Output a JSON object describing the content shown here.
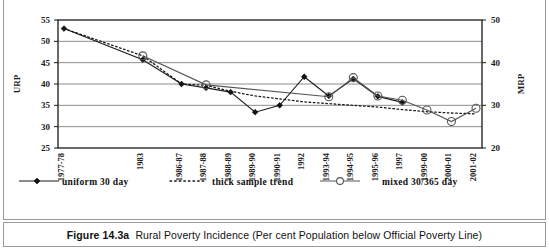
{
  "figure": {
    "caption_label": "Figure 14.3a",
    "caption_text": "Rural Poverty Incidence (Per cent Population below Official Poverty Line)"
  },
  "legend": {
    "position": "bottom",
    "items": [
      {
        "label": "uniform 30 day",
        "marker": "filled-diamond",
        "line": "solid",
        "color": "#1a1a1a"
      },
      {
        "label": "thick sample trend",
        "marker": "none",
        "line": "dotted",
        "color": "#1a1a1a"
      },
      {
        "label": "mixed 30/365 day",
        "marker": "open-circle",
        "line": "solid",
        "color": "#555555"
      }
    ]
  },
  "chart_data": {
    "type": "line",
    "title": "",
    "xlabel": "",
    "ylabel": "URP",
    "y2label": "MRP",
    "grid": true,
    "ylim": [
      25,
      55
    ],
    "yticks": [
      25,
      30,
      35,
      40,
      45,
      50,
      55
    ],
    "y2lim": [
      20,
      50
    ],
    "y2ticks": [
      20,
      30,
      40,
      50
    ],
    "categories": [
      "1977-78",
      "1983",
      "1986-87",
      "1987-88",
      "1988-89",
      "1989-90",
      "1990-91",
      "1992",
      "1993-94",
      "1994-95",
      "1995-96",
      "1997",
      "1999-00",
      "2000-01",
      "2001-02"
    ],
    "x_positions": [
      0,
      3.05,
      4.55,
      5.5,
      6.45,
      7.4,
      8.35,
      9.3,
      10.25,
      11.2,
      12.15,
      13.1,
      14.05,
      15.0,
      15.95
    ],
    "series": [
      {
        "name": "uniform 30 day",
        "axis": "left",
        "values": [
          53.0,
          45.7,
          40.0,
          39.1,
          38.1,
          33.4,
          35.0,
          41.7,
          37.2,
          41.2,
          37.1,
          35.7,
          null,
          null,
          null
        ]
      },
      {
        "name": "thick sample trend",
        "axis": "left",
        "values": [
          53.0,
          46.6,
          40.0,
          39.7,
          38.3,
          37.2,
          36.5,
          35.8,
          35.4,
          35.0,
          34.6,
          34.0,
          33.5,
          33.2,
          33.0
        ]
      },
      {
        "name": "mixed 30/365 day",
        "axis": "right",
        "values": [
          null,
          41.6,
          null,
          34.8,
          null,
          null,
          null,
          null,
          32.0,
          36.5,
          32.2,
          31.2,
          28.9,
          26.2,
          29.3
        ]
      }
    ]
  }
}
